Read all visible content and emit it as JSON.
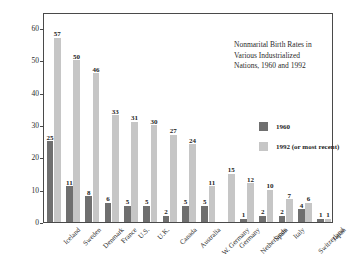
{
  "chart_data": {
    "type": "bar",
    "title": "Nonmarital Birth Rates in Various Industrialized Nations, 1960 and 1992",
    "title_lines": [
      "Nonmarital Birth Rates in",
      "Various Industrialized",
      "Nations, 1960 and 1992"
    ],
    "xlabel": "",
    "ylabel": "Percent of All Births",
    "ylim": [
      0,
      65
    ],
    "yticks": [
      0,
      10,
      20,
      30,
      40,
      50,
      60
    ],
    "ytick_labels": [
      "0",
      "10",
      "20",
      "30",
      "40",
      "50",
      "60"
    ],
    "grid": false,
    "legend_position": "upper right inside",
    "categories": [
      "Iceland",
      "Sweden",
      "Denmark",
      "France",
      "U.S.",
      "U.K.",
      "Canada",
      "Australia",
      "W. Germany",
      "Germany",
      "Netherlands",
      "Spain",
      "Italy",
      "Switzerland",
      "Japan"
    ],
    "series": [
      {
        "name": "1960",
        "color": "#6f6f6f",
        "values": [
          25,
          11,
          8,
          6,
          5,
          5,
          2,
          5,
          5,
          null,
          1,
          2,
          2,
          4,
          1
        ],
        "labels": [
          "25",
          "11",
          "8",
          "6",
          "5",
          "5",
          "2",
          "5",
          "5",
          "",
          "1",
          "2",
          "2",
          "4",
          "1"
        ]
      },
      {
        "name": "1992 (or most recent)",
        "color": "#c6c6c6",
        "values": [
          57,
          50,
          46,
          33,
          31,
          30,
          27,
          24,
          11,
          15,
          12,
          10,
          7,
          6,
          1
        ],
        "labels": [
          "57",
          "50",
          "46",
          "33",
          "31",
          "30",
          "27",
          "24",
          "11",
          "15",
          "12",
          "10",
          "7",
          "6",
          "1"
        ]
      }
    ]
  },
  "legend": {
    "items": [
      {
        "label": "1960"
      },
      {
        "label": "1992 (or most recent)"
      }
    ]
  },
  "colors": {
    "series_1960": "#6f6f6f",
    "series_1992": "#c6c6c6",
    "frame": "#4a4a4a",
    "text": "#2b2b2b",
    "background": "#ffffff"
  }
}
